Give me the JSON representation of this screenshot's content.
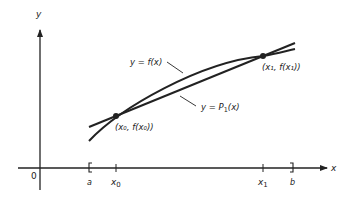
{
  "figure": {
    "axes": {
      "x_label": "x",
      "y_label": "y",
      "origin_label": "0"
    },
    "interval": {
      "left_label": "a",
      "right_label": "b"
    },
    "ticks": {
      "x0_label": "x",
      "x0_sub": "0",
      "x1_label": "x",
      "x1_sub": "1"
    },
    "curves": {
      "f_label": "y = f(x)",
      "p1_label_main": "y = P",
      "p1_label_sub": "1",
      "p1_label_tail": "(x)"
    },
    "points": {
      "p0_label": "(x₀, f(x₀))",
      "p1_label": "(x₁, f(x₁))"
    },
    "colors": {
      "ink": "#222222",
      "background": "#ffffff"
    }
  }
}
